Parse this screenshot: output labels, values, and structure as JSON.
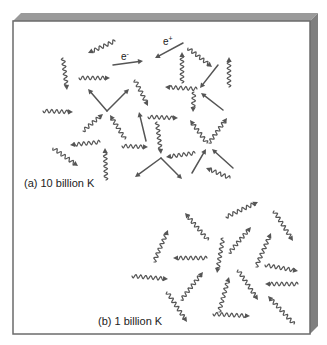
{
  "diagram": {
    "colors": {
      "background": "#ffffff",
      "panel_face": "#ffffff",
      "panel_border": "#6b6b6b",
      "panel_top_bevel": "#9a9a9a",
      "panel_side_bevel": "#7f7f7f",
      "particle": "#555555"
    },
    "panel": {
      "face": {
        "x": 13,
        "y": 21,
        "w": 297,
        "h": 313
      },
      "depth": 8
    },
    "labels": {
      "panel_a": "(a) 10 billion K",
      "panel_b": "(b) 1 billion K",
      "electron": "e",
      "electron_sign": "-",
      "positron": "e",
      "positron_sign": "+"
    },
    "legend_semantics": {
      "wavy_arrow": "photon",
      "straight_arrow": "electron / positron"
    },
    "panel_a_particles": [
      {
        "type": "photon",
        "from": [
          115,
          41
        ],
        "to": [
          88,
          53
        ]
      },
      {
        "type": "electron",
        "from": [
          113,
          65
        ],
        "to": [
          143,
          61
        ]
      },
      {
        "type": "positron",
        "from": [
          183,
          43
        ],
        "to": [
          155,
          58
        ]
      },
      {
        "type": "photon",
        "from": [
          63,
          58
        ],
        "to": [
          67,
          90
        ]
      },
      {
        "type": "photon",
        "from": [
          79,
          78
        ],
        "to": [
          110,
          78
        ]
      },
      {
        "type": "electron",
        "from": [
          107,
          111
        ],
        "to": [
          88,
          89
        ]
      },
      {
        "type": "electron",
        "from": [
          107,
          111
        ],
        "to": [
          129,
          89
        ]
      },
      {
        "type": "photon",
        "from": [
          43,
          111
        ],
        "to": [
          73,
          112
        ]
      },
      {
        "type": "photon",
        "from": [
          83,
          131
        ],
        "to": [
          103,
          114
        ]
      },
      {
        "type": "photon",
        "from": [
          125,
          139
        ],
        "to": [
          110,
          115
        ]
      },
      {
        "type": "photon",
        "from": [
          135,
          80
        ],
        "to": [
          148,
          106
        ]
      },
      {
        "type": "electron",
        "from": [
          146,
          141
        ],
        "to": [
          139,
          112
        ]
      },
      {
        "type": "photon",
        "from": [
          182,
          83
        ],
        "to": [
          182,
          52
        ]
      },
      {
        "type": "photon",
        "from": [
          188,
          48
        ],
        "to": [
          212,
          67
        ]
      },
      {
        "type": "electron",
        "from": [
          218,
          65
        ],
        "to": [
          200,
          88
        ]
      },
      {
        "type": "photon",
        "from": [
          229,
          87
        ],
        "to": [
          229,
          57
        ]
      },
      {
        "type": "photon",
        "from": [
          197,
          89
        ],
        "to": [
          165,
          87
        ]
      },
      {
        "type": "photon",
        "from": [
          194,
          92
        ],
        "to": [
          193,
          112
        ]
      },
      {
        "type": "electron",
        "from": [
          223,
          110
        ],
        "to": [
          201,
          93
        ]
      },
      {
        "type": "photon",
        "from": [
          100,
          142
        ],
        "to": [
          70,
          145
        ]
      },
      {
        "type": "photon",
        "from": [
          53,
          148
        ],
        "to": [
          78,
          166
        ]
      },
      {
        "type": "photon",
        "from": [
          106,
          180
        ],
        "to": [
          105,
          148
        ]
      },
      {
        "type": "photon",
        "from": [
          122,
          146
        ],
        "to": [
          148,
          147
        ]
      },
      {
        "type": "photon",
        "from": [
          157,
          122
        ],
        "to": [
          161,
          154
        ]
      },
      {
        "type": "photon",
        "from": [
          148,
          117
        ],
        "to": [
          178,
          118
        ]
      },
      {
        "type": "electron",
        "from": [
          161,
          158
        ],
        "to": [
          135,
          177
        ]
      },
      {
        "type": "electron",
        "from": [
          161,
          158
        ],
        "to": [
          182,
          179
        ]
      },
      {
        "type": "photon",
        "from": [
          195,
          153
        ],
        "to": [
          166,
          157
        ]
      },
      {
        "type": "photon",
        "from": [
          207,
          143
        ],
        "to": [
          190,
          120
        ]
      },
      {
        "type": "photon",
        "from": [
          209,
          143
        ],
        "to": [
          227,
          118
        ]
      },
      {
        "type": "electron",
        "from": [
          192,
          173
        ],
        "to": [
          206,
          149
        ]
      },
      {
        "type": "electron",
        "from": [
          233,
          168
        ],
        "to": [
          212,
          149
        ]
      },
      {
        "type": "photon",
        "from": [
          230,
          178
        ],
        "to": [
          206,
          168
        ]
      }
    ],
    "panel_b_particles": [
      {
        "type": "photon",
        "from": [
          208,
          240
        ],
        "to": [
          185,
          213
        ]
      },
      {
        "type": "photon",
        "from": [
          154,
          262
        ],
        "to": [
          168,
          230
        ]
      },
      {
        "type": "photon",
        "from": [
          207,
          258
        ],
        "to": [
          173,
          258
        ]
      },
      {
        "type": "photon",
        "from": [
          223,
          238
        ],
        "to": [
          217,
          273
        ]
      },
      {
        "type": "photon",
        "from": [
          226,
          217
        ],
        "to": [
          258,
          202
        ]
      },
      {
        "type": "photon",
        "from": [
          274,
          211
        ],
        "to": [
          293,
          241
        ]
      },
      {
        "type": "photon",
        "from": [
          229,
          253
        ],
        "to": [
          251,
          227
        ]
      },
      {
        "type": "photon",
        "from": [
          256,
          267
        ],
        "to": [
          271,
          233
        ]
      },
      {
        "type": "photon",
        "from": [
          265,
          265
        ],
        "to": [
          298,
          271
        ]
      },
      {
        "type": "photon",
        "from": [
          132,
          276
        ],
        "to": [
          168,
          279
        ]
      },
      {
        "type": "photon",
        "from": [
          181,
          300
        ],
        "to": [
          203,
          272
        ]
      },
      {
        "type": "photon",
        "from": [
          167,
          292
        ],
        "to": [
          187,
          322
        ]
      },
      {
        "type": "photon",
        "from": [
          219,
          312
        ],
        "to": [
          229,
          277
        ]
      },
      {
        "type": "photon",
        "from": [
          238,
          270
        ],
        "to": [
          258,
          300
        ]
      },
      {
        "type": "photon",
        "from": [
          298,
          284
        ],
        "to": [
          265,
          284
        ]
      },
      {
        "type": "photon",
        "from": [
          294,
          324
        ],
        "to": [
          268,
          296
        ]
      },
      {
        "type": "photon",
        "from": [
          213,
          314
        ],
        "to": [
          250,
          316
        ]
      }
    ]
  }
}
